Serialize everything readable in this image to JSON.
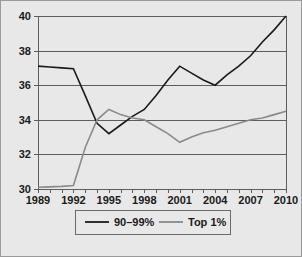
{
  "figure": {
    "background_color": "#e8e8e8",
    "border_color": "#9a9a9a",
    "plot_bg_color": "#e8e8e8",
    "grid_color": "#5d5d5d",
    "axis_color": "#5d5d5d"
  },
  "legend": {
    "position": "bottom-center",
    "border_color": "#6b6b6b",
    "entries": [
      {
        "label": "90–99%",
        "color": "#1a1a1a"
      },
      {
        "label": "Top 1%",
        "color": "#8a8a8a"
      }
    ]
  },
  "chart_data": {
    "type": "line",
    "title": "",
    "subtitle": "",
    "xlabel": "",
    "ylabel": "",
    "grid": true,
    "legend_position": "bottom-center",
    "xlim": [
      1989,
      2010
    ],
    "ylim": [
      30,
      40
    ],
    "ytick_values": [
      30,
      32,
      34,
      36,
      38,
      40
    ],
    "ytick_labels": [
      "30",
      "32",
      "34",
      "36",
      "38",
      "40"
    ],
    "x": [
      1989,
      1990,
      1991,
      1992,
      1993,
      1994,
      1995,
      1996,
      1997,
      1998,
      1999,
      2000,
      2001,
      2002,
      2003,
      2004,
      2005,
      2006,
      2007,
      2008,
      2009,
      2010
    ],
    "xtick_values": [
      1989,
      1990,
      1991,
      1992,
      1993,
      1994,
      1995,
      1996,
      1997,
      1998,
      1999,
      2000,
      2001,
      2002,
      2003,
      2004,
      2005,
      2006,
      2007,
      2008,
      2009,
      2010
    ],
    "xtick_labels": [
      "1989",
      "",
      "",
      "1992",
      "",
      "",
      "1995",
      "",
      "",
      "1998",
      "",
      "",
      "2001",
      "",
      "",
      "2004",
      "",
      "",
      "2007",
      "",
      "",
      "2010"
    ],
    "series": [
      {
        "name": "90–99%",
        "color": "#1a1a1a",
        "width": 1.6,
        "values": [
          37.1,
          37.05,
          37.0,
          36.95,
          35.4,
          33.8,
          33.2,
          33.7,
          34.2,
          34.6,
          35.4,
          36.3,
          37.1,
          36.7,
          36.3,
          36.0,
          36.6,
          37.1,
          37.7,
          38.5,
          39.2,
          40.0
        ]
      },
      {
        "name": "Top 1%",
        "color": "#8a8a8a",
        "width": 1.6,
        "values": [
          30.1,
          30.12,
          30.15,
          30.2,
          32.4,
          34.0,
          34.6,
          34.3,
          34.1,
          34.0,
          33.6,
          33.2,
          32.7,
          33.0,
          33.25,
          33.4,
          33.6,
          33.8,
          34.0,
          34.1,
          34.3,
          34.5
        ]
      }
    ]
  }
}
